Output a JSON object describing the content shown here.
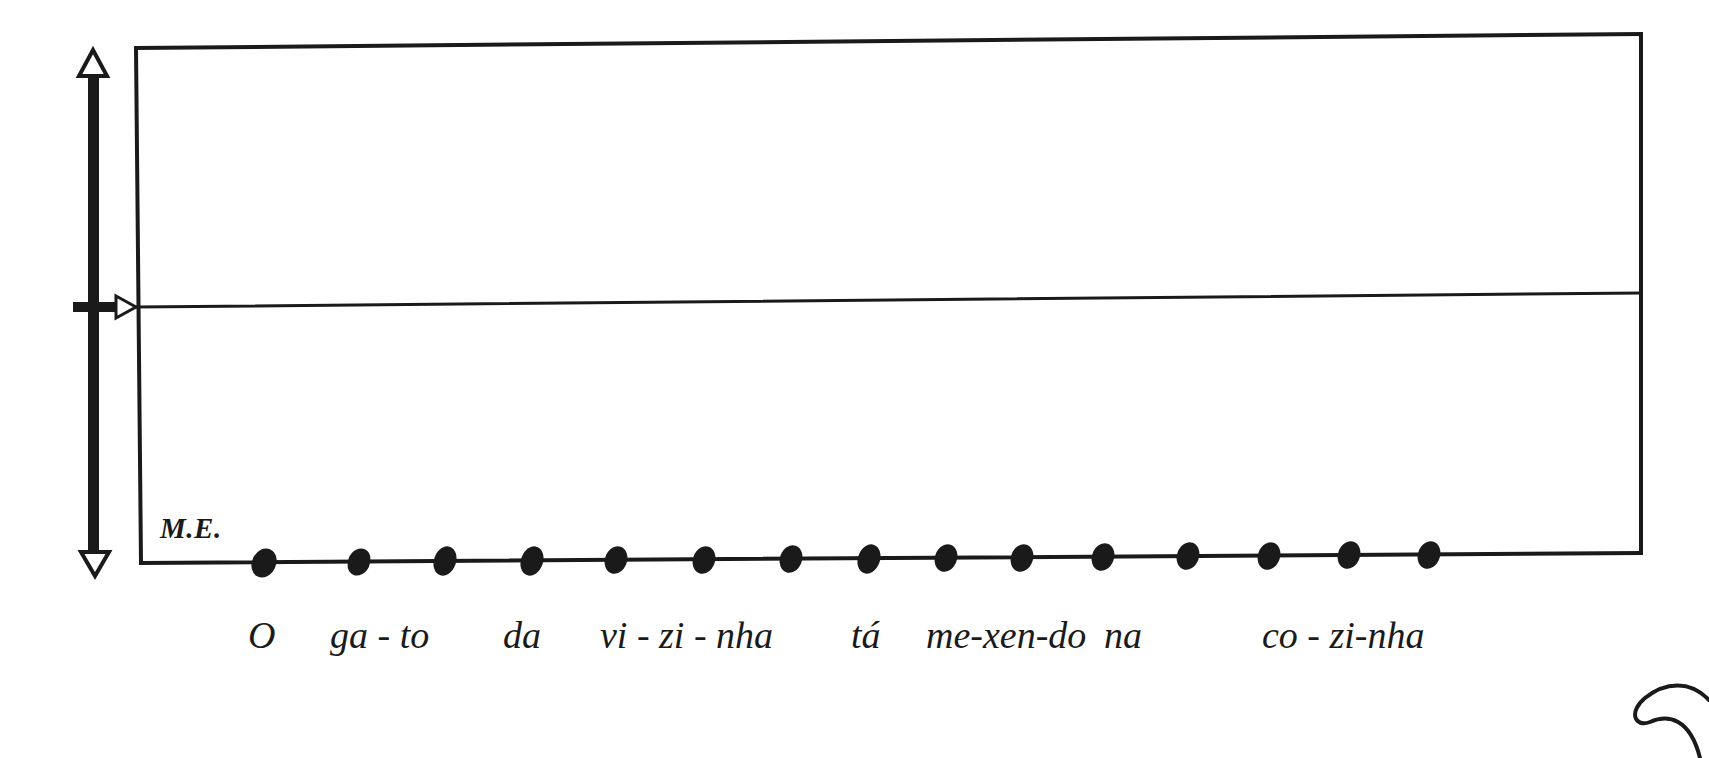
{
  "diagram": {
    "type": "intonation-contour-chart",
    "register_label": "M.E.",
    "stroke_color": "#1a1a1a",
    "background": "#ffffff",
    "pitch_axis": {
      "top_arrow": "up-arrow-hollow",
      "bottom_arrow": "down-arrow-hollow",
      "mid_marker": "right-arrow-hollow"
    },
    "frame": {
      "left": 137,
      "top": 48,
      "right": 1641,
      "bottom": 558,
      "midline_left_y": 307,
      "midline_right_y": 293
    },
    "sentence": "O gato da vizinha tá mexendo na cozinha",
    "syllables": [
      "O",
      "ga",
      "to",
      "da",
      "vi",
      "zi",
      "nha",
      "tá",
      "me",
      "xen",
      "do",
      "na",
      "co",
      "zi",
      "nha"
    ],
    "syllable_count": 15,
    "text_segments": [
      {
        "text": "O",
        "x": 248
      },
      {
        "text": "ga - to",
        "x": 330
      },
      {
        "text": "da",
        "x": 503
      },
      {
        "text": "vi - zi - nha",
        "x": 600
      },
      {
        "text": "tá",
        "x": 851
      },
      {
        "text": "me-xen-do",
        "x": 926
      },
      {
        "text": "na",
        "x": 1104
      },
      {
        "text": "co - zi-nha",
        "x": 1262
      }
    ],
    "dots_x": [
      264,
      359,
      445,
      532,
      616,
      704,
      791,
      869,
      946,
      1022,
      1103,
      1188,
      1269,
      1349,
      1429
    ]
  }
}
